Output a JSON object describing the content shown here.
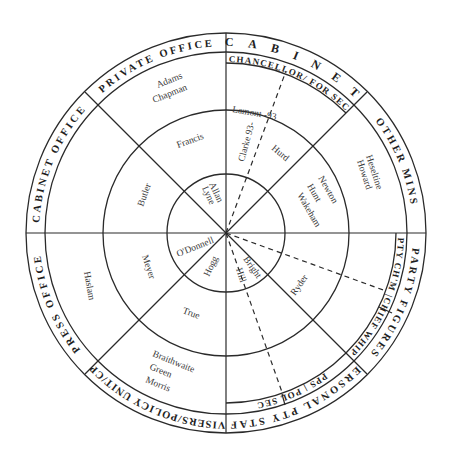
{
  "outer_bands": {
    "cabinet": "C A B I N E T",
    "private_office": "PRIVATE OFFICE",
    "cabinet_office": "CABINET OFFICE",
    "press_office": "PRESS OFFICE",
    "advisers": "ADVISERS/POLICY UNIT/CPRS",
    "personal_pty_staff": "PERSONAL PTY STAFF",
    "party_figures": "PARTY FIGURES",
    "other_mins": "OTHER MINS"
  },
  "sub_bands": {
    "chancellor_for_sec": "CHANCELLOR/ FOR SEC",
    "pty_chm_chief_whip": "PTY CH'M |CHIEF WHIP",
    "pps_pol_sec": "PPS | POL SEC"
  },
  "names": {
    "adams": "Adams",
    "chapman": "Chapman",
    "lamont": "Lamont -93",
    "clarke": "Clarke 93-",
    "hurd": "Hurd",
    "heseltine": "Heseltine",
    "howard": "Howard",
    "newton": "Newton",
    "hunt": "Hunt",
    "wakeham": "Wakeham",
    "francis": "Francis",
    "butler": "Butler",
    "allan": "Allan",
    "lyne": "Lyne",
    "odonnell": "O'Donnell",
    "meyer": "Meyer",
    "haslam": "Haslam",
    "hogg": "Hogg",
    "bright": "Bright",
    "hill": "Hill",
    "ryder": "Ryder",
    "true": "True",
    "braithwaite": "Braithwaite",
    "green": "Green",
    "morris": "Morris"
  },
  "geometry": {
    "center": [
      226,
      233
    ],
    "radii": {
      "inner": 59,
      "middle": 123,
      "sub_band": 170,
      "band_inner": 181,
      "outer": 200
    }
  }
}
